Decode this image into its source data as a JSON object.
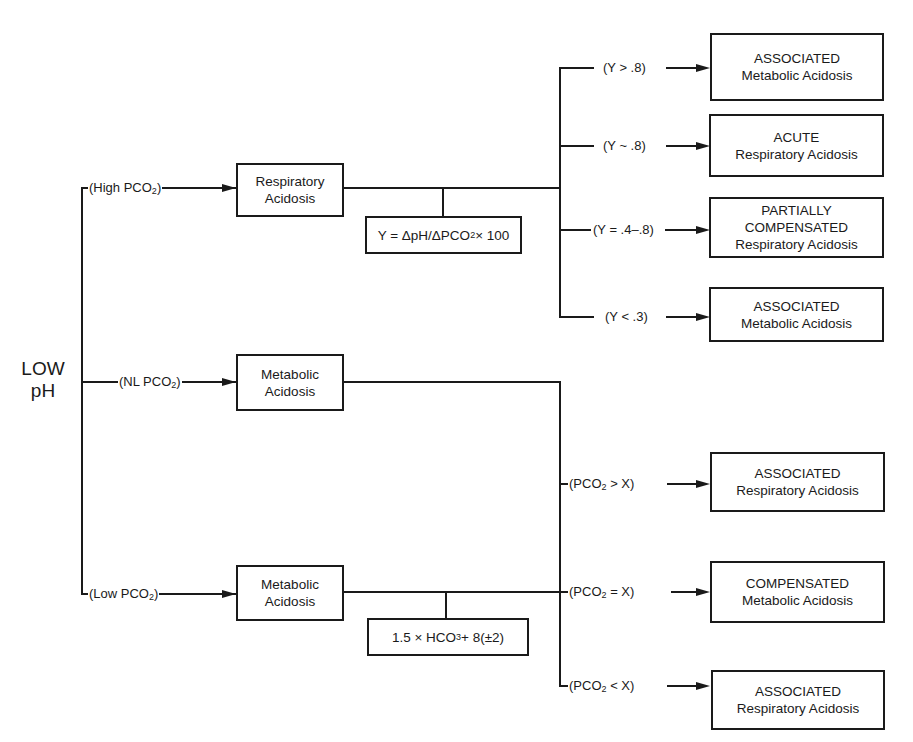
{
  "root": {
    "line1": "LOW",
    "line2": "pH"
  },
  "branches": [
    {
      "condition": {
        "pre": "(High PCO",
        "sub": "2",
        "post": ")"
      },
      "diagnosis": {
        "line1": "Respiratory",
        "line2": "Acidosis"
      },
      "formula": {
        "text": "Y = ΔpH/ΔPCO",
        "sub": "2",
        "post": " × 100"
      },
      "outcomes": [
        {
          "condition": "(Y > .8)",
          "line1": "ASSOCIATED",
          "line2": "Metabolic Acidosis"
        },
        {
          "condition": "(Y ~ .8)",
          "line1": "ACUTE",
          "line2": "Respiratory Acidosis"
        },
        {
          "condition": "(Y = .4–.8)",
          "line1": "PARTIALLY",
          "line2": "COMPENSATED",
          "line3": "Respiratory Acidosis"
        },
        {
          "condition": "(Y < .3)",
          "line1": "ASSOCIATED",
          "line2": "Metabolic Acidosis"
        }
      ]
    },
    {
      "condition": {
        "pre": "(NL PCO",
        "sub": "2",
        "post": ")"
      },
      "diagnosis": {
        "line1": "Metabolic",
        "line2": "Acidosis"
      }
    },
    {
      "condition": {
        "pre": "(Low PCO",
        "sub": "2",
        "post": ")"
      },
      "diagnosis": {
        "line1": "Metabolic",
        "line2": "Acidosis"
      },
      "formula": {
        "text": "1.5 × HCO",
        "sub": "3",
        "post": " + 8(±2)"
      },
      "outcomes": [
        {
          "condition": {
            "pre": "(PCO",
            "sub": "2",
            "post": " > X)"
          },
          "line1": "ASSOCIATED",
          "line2": "Respiratory Acidosis"
        },
        {
          "condition": {
            "pre": "(PCO",
            "sub": "2",
            "post": " = X)"
          },
          "line1": "COMPENSATED",
          "line2": "Metabolic Acidosis"
        },
        {
          "condition": {
            "pre": "(PCO",
            "sub": "2",
            "post": " < X)"
          },
          "line1": "ASSOCIATED",
          "line2": "Respiratory Acidosis"
        }
      ]
    }
  ]
}
